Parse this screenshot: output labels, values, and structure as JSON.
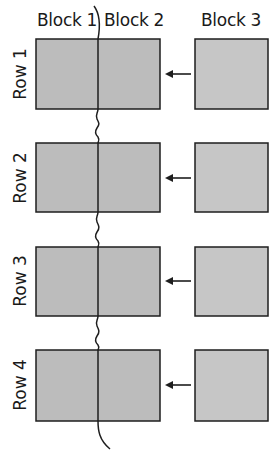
{
  "diagram": {
    "column_headers": [
      {
        "label": "Block 1",
        "x": 37
      },
      {
        "label": "Block 2",
        "x": 104
      },
      {
        "label": "Block 3",
        "x": 201
      }
    ],
    "rows": [
      {
        "label": "Row 1",
        "top": 39,
        "bottom": 109
      },
      {
        "label": "Row 2",
        "top": 143,
        "bottom": 212
      },
      {
        "label": "Row 3",
        "top": 247,
        "bottom": 316
      },
      {
        "label": "Row 4",
        "top": 350,
        "bottom": 421
      }
    ],
    "arrow_direction": "left",
    "colors": {
      "merged_block_fill": "#bcbcbc",
      "block3_fill": "#c6c6c6",
      "stroke": "#1e1e1e"
    }
  }
}
